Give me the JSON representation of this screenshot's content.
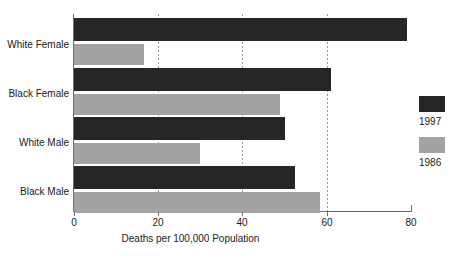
{
  "chart_data": {
    "type": "bar",
    "orientation": "horizontal",
    "title": "",
    "xlabel": "Deaths per 100,000 Population",
    "ylabel": "",
    "xlim": [
      0,
      80
    ],
    "xticks": [
      "0",
      "20",
      "40",
      "60",
      "80"
    ],
    "xtick_values": [
      0,
      20,
      40,
      60,
      80
    ],
    "gridlines": [
      20,
      40,
      60
    ],
    "grid": "vertical dotted at 20, 40, 60",
    "legend_position": "right",
    "categories": [
      "White Female",
      "Black Female",
      "White Male",
      "Black Male"
    ],
    "series": [
      {
        "name": "1997",
        "color": "#262626",
        "values": [
          79,
          61,
          50,
          52.5
        ]
      },
      {
        "name": "1986",
        "color": "#a3a3a3",
        "values": [
          16.7,
          49,
          30,
          58.5
        ]
      }
    ]
  },
  "axis": {
    "x_title": "Deaths per 100,000 Population",
    "ticks": [
      {
        "label": "0",
        "value": 0
      },
      {
        "label": "20",
        "value": 20
      },
      {
        "label": "40",
        "value": 40
      },
      {
        "label": "60",
        "value": 60
      },
      {
        "label": "80",
        "value": 80
      }
    ]
  },
  "categories": [
    {
      "label": "White Female"
    },
    {
      "label": "Black Female"
    },
    {
      "label": "White Male"
    },
    {
      "label": "Black Male"
    }
  ],
  "legend": {
    "items": [
      {
        "label": "1997",
        "color": "#262626",
        "swatch": "legend-swatch-1997"
      },
      {
        "label": "1986",
        "color": "#a3a3a3",
        "swatch": "legend-swatch-1986"
      }
    ]
  },
  "colors": {
    "series_1997": "#262626",
    "series_1986": "#a3a3a3",
    "axis": "#6e6e6e",
    "grid": "#9a9a9a",
    "background": "#ffffff",
    "text": "#1a1a1a"
  }
}
